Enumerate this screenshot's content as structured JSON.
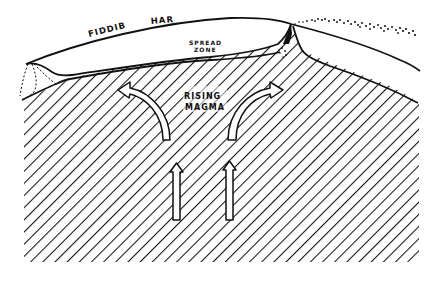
{
  "diagram": {
    "type": "cross-section",
    "labels": {
      "crust_word_1": "FIDDIB",
      "crust_word_2": "HAR",
      "spread_zone_line_1": "SPREAD",
      "spread_zone_line_2": "ZONE",
      "magma_line_1": "RISING",
      "magma_line_2": "MAGMA"
    },
    "elements": [
      {
        "id": "outer-surface",
        "kind": "curved line",
        "description": "top surface of the ocean crust"
      },
      {
        "id": "crust-layer",
        "kind": "band",
        "description": "thin crust layer above the mantle"
      },
      {
        "id": "ridge-peak",
        "kind": "peak",
        "description": "ridge crest with dark fissure"
      },
      {
        "id": "ejecta",
        "kind": "dots",
        "description": "spray of particles from the ridge crest"
      },
      {
        "id": "mantle",
        "kind": "hatched region",
        "description": "diagonal hatching representing magma/mantle"
      },
      {
        "id": "arrows-vertical",
        "kind": "arrows",
        "count": 2,
        "direction": "up"
      },
      {
        "id": "arrows-curved",
        "kind": "arrows",
        "count": 2,
        "direction": "diverging left and right"
      }
    ],
    "colors": {
      "ink": "#111111",
      "paper": "#ffffff"
    }
  }
}
